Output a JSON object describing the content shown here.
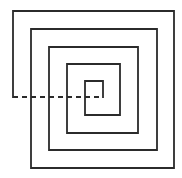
{
  "diagram": {
    "title": "",
    "type": "square-spiral",
    "stroke_color": "#2b2b2b",
    "background": "#ffffff",
    "stroke_width": 1.8,
    "solid_path": [
      [
        103,
        97
      ],
      [
        103,
        81
      ],
      [
        85,
        81
      ],
      [
        85,
        115
      ],
      [
        120,
        115
      ],
      [
        120,
        64
      ],
      [
        67,
        64
      ],
      [
        67,
        133
      ],
      [
        138,
        133
      ],
      [
        138,
        47
      ],
      [
        49,
        47
      ],
      [
        49,
        150
      ],
      [
        157,
        150
      ],
      [
        157,
        29
      ],
      [
        31,
        29
      ],
      [
        31,
        168
      ],
      [
        174,
        168
      ],
      [
        174,
        11
      ],
      [
        13,
        11
      ],
      [
        13,
        97
      ]
    ],
    "dashed_segment": {
      "from": [
        13,
        97
      ],
      "to": [
        103,
        97
      ],
      "dash": "5,4"
    }
  }
}
